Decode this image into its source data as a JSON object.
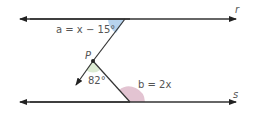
{
  "diagram": {
    "lines": {
      "r": {
        "label": "r",
        "y": 19,
        "x1": 17,
        "x2": 243
      },
      "s": {
        "label": "s",
        "y": 102,
        "x1": 17,
        "x2": 243
      }
    },
    "point": {
      "label": "P",
      "x": 93,
      "y": 61
    },
    "angles": {
      "a": {
        "label": "a = x − 15°",
        "color": "#b7d3ee"
      },
      "p": {
        "label": "82°",
        "color": "#dcebd3"
      },
      "b": {
        "label": "b = 2x",
        "color": "#e3c4d2"
      }
    },
    "colors": {
      "line": "#333333",
      "text": "#555555"
    }
  }
}
